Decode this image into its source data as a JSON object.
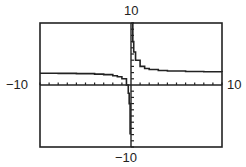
{
  "chart_data": {
    "type": "line",
    "title": "",
    "xlim": [
      -10,
      10
    ],
    "ylim": [
      -10,
      10
    ],
    "xlabel": "",
    "ylabel": "",
    "grid": false,
    "tick_spacing": 1,
    "window_labels": {
      "xmin": "−10",
      "xmax": "10",
      "ymin": "−10",
      "ymax": "10"
    },
    "asymptotes": {
      "vertical_x": 0,
      "horizontal_y": 2
    },
    "series": [
      {
        "name": "f(x)",
        "x": [
          -10,
          -8,
          -6,
          -4,
          -3,
          -2,
          -1.5,
          -1,
          -0.5,
          -0.3,
          -0.2,
          -0.1
        ],
        "y": [
          1.9,
          1.88,
          1.83,
          1.75,
          1.67,
          1.5,
          1.33,
          1.0,
          0.0,
          -1.33,
          -3.0,
          -8.0
        ]
      },
      {
        "name": "f(x) right branch",
        "x": [
          0.12,
          0.2,
          0.3,
          0.5,
          1,
          1.5,
          2,
          3,
          4,
          6,
          8,
          10
        ],
        "y": [
          10.3,
          7.0,
          5.33,
          4.0,
          3.0,
          2.67,
          2.5,
          2.33,
          2.25,
          2.17,
          2.13,
          2.1
        ]
      }
    ]
  }
}
